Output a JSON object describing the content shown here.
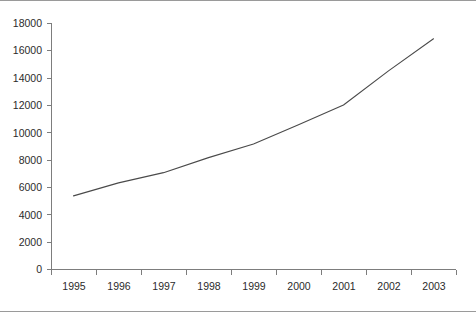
{
  "chart_data": {
    "type": "line",
    "title": "",
    "subtitle": "",
    "xlabel": "",
    "ylabel": "",
    "categories": [
      "1995",
      "1996",
      "1997",
      "1998",
      "1999",
      "2000",
      "2001",
      "2002",
      "2003"
    ],
    "x": [
      1995,
      1996,
      1997,
      1998,
      1999,
      2000,
      2001,
      2002,
      2003
    ],
    "values": [
      5350,
      6300,
      7050,
      8150,
      9150,
      10550,
      12000,
      14500,
      16850
    ],
    "series": [
      {
        "name": "series-1",
        "values": [
          5350,
          6300,
          7050,
          8150,
          9150,
          10550,
          12000,
          14500,
          16850
        ],
        "color": "#4a4a4a"
      }
    ],
    "ylim": [
      0,
      18000
    ],
    "ytick_step": 2000,
    "yticks": [
      0,
      2000,
      4000,
      6000,
      8000,
      10000,
      12000,
      14000,
      16000,
      18000
    ],
    "ytick_labels": [
      "0",
      "2000",
      "4000",
      "6000",
      "8000",
      "10000",
      "12000",
      "14000",
      "16000",
      "18000"
    ],
    "xtick_labels": [
      "1995",
      "1996",
      "1997",
      "1998",
      "1999",
      "2000",
      "2001",
      "2002",
      "2003"
    ],
    "grid": false,
    "legend": false,
    "legend_position": "none",
    "marker": "none",
    "axis_color": "#7d7d7d",
    "line_color": "#4a4a4a",
    "background_color": "#ffffff",
    "border_color": "#9a9a9a",
    "annotations": []
  },
  "geometry": {
    "plot_left": 51,
    "plot_right": 456,
    "plot_baseline_y": 268,
    "plot_top_y": 22,
    "band_width": 45,
    "first_band_center_offset": 22.5,
    "tick_length": 5,
    "point_x": [
      70,
      113,
      155,
      196,
      238,
      300,
      322,
      380,
      435
    ],
    "point_y": [
      195,
      182,
      172,
      157,
      143,
      124,
      104,
      70,
      38
    ]
  }
}
